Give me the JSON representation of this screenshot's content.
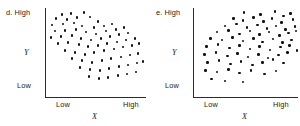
{
  "figure": {
    "background": "#ffffff",
    "dot_color": "#111111",
    "axis_color": "#2b2b2b"
  },
  "chart_data": [
    {
      "type": "scatter",
      "panel_label": "d. High",
      "panel_letter": "d.",
      "title": "",
      "xlabel": "X",
      "ylabel": "Y",
      "x_tick_labels": [
        "Low",
        "High"
      ],
      "y_tick_labels": [
        "Low",
        "High"
      ],
      "y_high_label": "High",
      "y_low_label": "Low",
      "x_low_label": "Low",
      "x_high_label": "High",
      "grid": false,
      "legend": false,
      "xlim": [
        0,
        100
      ],
      "ylim": [
        0,
        100
      ],
      "relationship": "negative",
      "n_points": 72,
      "points": [
        [
          16,
          93
        ],
        [
          25,
          94
        ],
        [
          38,
          95
        ],
        [
          10,
          88
        ],
        [
          21,
          87
        ],
        [
          31,
          89
        ],
        [
          44,
          90
        ],
        [
          52,
          85
        ],
        [
          6,
          81
        ],
        [
          17,
          82
        ],
        [
          28,
          83
        ],
        [
          36,
          80
        ],
        [
          48,
          78
        ],
        [
          58,
          80
        ],
        [
          66,
          82
        ],
        [
          9,
          74
        ],
        [
          19,
          75
        ],
        [
          30,
          76
        ],
        [
          40,
          73
        ],
        [
          50,
          71
        ],
        [
          60,
          74
        ],
        [
          70,
          76
        ],
        [
          78,
          78
        ],
        [
          5,
          67
        ],
        [
          15,
          68
        ],
        [
          26,
          69
        ],
        [
          35,
          66
        ],
        [
          45,
          64
        ],
        [
          55,
          66
        ],
        [
          64,
          68
        ],
        [
          73,
          70
        ],
        [
          82,
          72
        ],
        [
          12,
          60
        ],
        [
          22,
          61
        ],
        [
          33,
          59
        ],
        [
          42,
          57
        ],
        [
          52,
          58
        ],
        [
          61,
          60
        ],
        [
          71,
          62
        ],
        [
          80,
          64
        ],
        [
          89,
          66
        ],
        [
          19,
          52
        ],
        [
          29,
          50
        ],
        [
          39,
          48
        ],
        [
          48,
          50
        ],
        [
          58,
          52
        ],
        [
          68,
          54
        ],
        [
          77,
          56
        ],
        [
          86,
          58
        ],
        [
          93,
          60
        ],
        [
          26,
          43
        ],
        [
          36,
          41
        ],
        [
          46,
          39
        ],
        [
          56,
          41
        ],
        [
          65,
          43
        ],
        [
          75,
          45
        ],
        [
          84,
          47
        ],
        [
          92,
          49
        ],
        [
          34,
          33
        ],
        [
          44,
          31
        ],
        [
          54,
          30
        ],
        [
          63,
          32
        ],
        [
          73,
          34
        ],
        [
          82,
          36
        ],
        [
          91,
          38
        ],
        [
          97,
          40
        ],
        [
          43,
          23
        ],
        [
          53,
          21
        ],
        [
          62,
          22
        ],
        [
          72,
          24
        ],
        [
          81,
          26
        ],
        [
          90,
          28
        ]
      ]
    },
    {
      "type": "scatter",
      "panel_label": "e. High",
      "panel_letter": "e.",
      "title": "",
      "xlabel": "X",
      "ylabel": "Y",
      "x_tick_labels": [
        "Low",
        "High"
      ],
      "y_tick_labels": [
        "Low",
        "High"
      ],
      "y_high_label": "High",
      "y_low_label": "Low",
      "x_low_label": "Low",
      "x_high_label": "High",
      "grid": false,
      "legend": false,
      "xlim": [
        0,
        100
      ],
      "ylim": [
        0,
        100
      ],
      "relationship": "positive-fan",
      "n_points": 74,
      "points": [
        [
          48,
          95
        ],
        [
          64,
          93
        ],
        [
          78,
          96
        ],
        [
          86,
          91
        ],
        [
          93,
          94
        ],
        [
          38,
          88
        ],
        [
          47,
          86
        ],
        [
          57,
          89
        ],
        [
          67,
          85
        ],
        [
          75,
          88
        ],
        [
          84,
          84
        ],
        [
          95,
          87
        ],
        [
          30,
          80
        ],
        [
          41,
          82
        ],
        [
          51,
          78
        ],
        [
          61,
          81
        ],
        [
          70,
          77
        ],
        [
          79,
          80
        ],
        [
          88,
          76
        ],
        [
          97,
          79
        ],
        [
          22,
          73
        ],
        [
          33,
          75
        ],
        [
          44,
          71
        ],
        [
          54,
          74
        ],
        [
          63,
          70
        ],
        [
          72,
          73
        ],
        [
          82,
          69
        ],
        [
          91,
          72
        ],
        [
          98,
          74
        ],
        [
          16,
          66
        ],
        [
          27,
          64
        ],
        [
          37,
          67
        ],
        [
          47,
          63
        ],
        [
          57,
          66
        ],
        [
          66,
          62
        ],
        [
          76,
          65
        ],
        [
          85,
          61
        ],
        [
          94,
          64
        ],
        [
          12,
          57
        ],
        [
          23,
          59
        ],
        [
          34,
          55
        ],
        [
          44,
          58
        ],
        [
          54,
          54
        ],
        [
          63,
          57
        ],
        [
          73,
          53
        ],
        [
          83,
          56
        ],
        [
          92,
          58
        ],
        [
          99,
          52
        ],
        [
          10,
          48
        ],
        [
          21,
          50
        ],
        [
          32,
          46
        ],
        [
          42,
          49
        ],
        [
          52,
          45
        ],
        [
          62,
          48
        ],
        [
          71,
          44
        ],
        [
          81,
          47
        ],
        [
          90,
          50
        ],
        [
          13,
          39
        ],
        [
          24,
          41
        ],
        [
          35,
          37
        ],
        [
          45,
          40
        ],
        [
          56,
          36
        ],
        [
          66,
          39
        ],
        [
          76,
          42
        ],
        [
          86,
          38
        ],
        [
          11,
          30
        ],
        [
          22,
          28
        ],
        [
          33,
          31
        ],
        [
          44,
          27
        ],
        [
          55,
          30
        ],
        [
          68,
          26
        ],
        [
          79,
          29
        ],
        [
          17,
          20
        ],
        [
          30,
          18
        ],
        [
          47,
          17
        ]
      ]
    }
  ]
}
